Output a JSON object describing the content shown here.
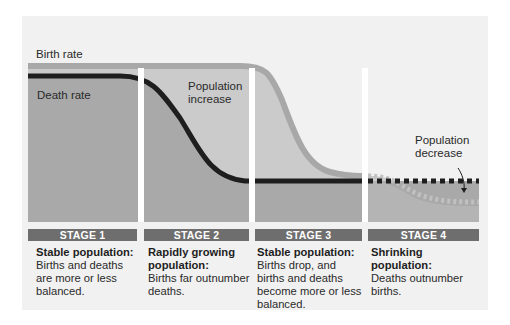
{
  "diagram": {
    "labels": {
      "birth_rate": "Birth rate",
      "death_rate": "Death rate",
      "population_increase": [
        "Population",
        "increase"
      ],
      "population_decrease": [
        "Population",
        "decrease"
      ]
    },
    "stages": [
      {
        "label": "STAGE 1",
        "title": "Stable population:",
        "body": "Births and deaths are more or less balanced."
      },
      {
        "label": "STAGE 2",
        "title": "Rapidly growing population:",
        "body": "Births far outnumber deaths."
      },
      {
        "label": "STAGE 3",
        "title": "Stable population:",
        "body": "Births drop, and births and deaths become more or less balanced."
      },
      {
        "label": "STAGE 4",
        "title": "Shrinking population:",
        "body": "Deaths outnumber births."
      }
    ],
    "colors": {
      "panel_background": "#f1f1f1",
      "death_area": "#a9a9a9",
      "increase_area": "#cbcbcb",
      "birth_rate_line": "#a8a8a8",
      "death_rate_line": "#1e1e1e",
      "stage_bar": "#6e6e6e",
      "column_gap": "#ffffff"
    }
  }
}
